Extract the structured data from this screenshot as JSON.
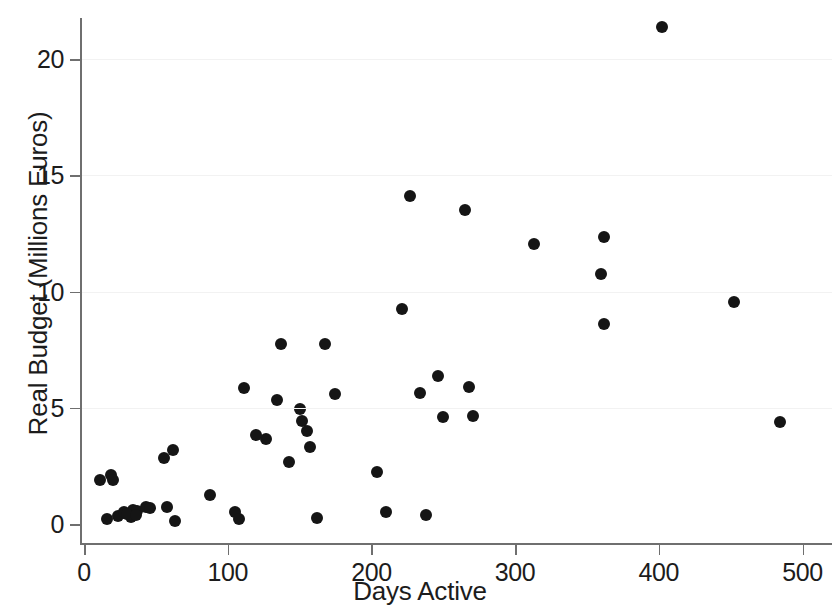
{
  "chart_data": {
    "type": "scatter",
    "title": "",
    "xlabel": "Days Active",
    "ylabel": "Real Budget (Millions Euros)",
    "xlim": [
      -8,
      520
    ],
    "ylim": [
      -0.7,
      22.6
    ],
    "xticks": [
      0,
      100,
      200,
      300,
      400,
      500
    ],
    "xtick_labels": [
      "0",
      "100",
      "200",
      "300",
      "400",
      "500"
    ],
    "yticks": [
      0,
      5,
      10,
      15,
      20
    ],
    "ytick_labels": [
      "0",
      "5",
      "10",
      "15",
      "20"
    ],
    "grid": false,
    "legend": "none",
    "marker": {
      "shape": "circle",
      "color": "#151515",
      "size": 12
    },
    "n_points": 52,
    "series": [
      {
        "name": "projects",
        "points": [
          [
            11,
            1.9
          ],
          [
            19,
            2.1
          ],
          [
            20,
            1.9
          ],
          [
            16,
            0.2
          ],
          [
            24,
            0.35
          ],
          [
            28,
            0.5
          ],
          [
            31,
            0.45
          ],
          [
            33,
            0.3
          ],
          [
            34,
            0.6
          ],
          [
            37,
            0.55
          ],
          [
            43,
            0.75
          ],
          [
            46,
            0.7
          ],
          [
            56,
            2.85
          ],
          [
            58,
            0.75
          ],
          [
            62,
            3.2
          ],
          [
            63,
            0.15
          ],
          [
            88,
            1.25
          ],
          [
            105,
            0.5
          ],
          [
            108,
            0.2
          ],
          [
            111,
            5.85
          ],
          [
            120,
            3.85
          ],
          [
            127,
            3.65
          ],
          [
            134,
            5.35
          ],
          [
            137,
            7.75
          ],
          [
            143,
            2.65
          ],
          [
            150,
            4.95
          ],
          [
            152,
            4.45
          ],
          [
            155,
            4.0
          ],
          [
            157,
            3.3
          ],
          [
            162,
            0.25
          ],
          [
            168,
            7.75
          ],
          [
            175,
            5.6
          ],
          [
            204,
            2.25
          ],
          [
            210,
            0.5
          ],
          [
            221,
            9.25
          ],
          [
            227,
            14.1
          ],
          [
            234,
            5.65
          ],
          [
            238,
            0.4
          ],
          [
            246,
            6.35
          ],
          [
            250,
            4.6
          ],
          [
            265,
            13.5
          ],
          [
            268,
            5.9
          ],
          [
            271,
            4.65
          ],
          [
            313,
            12.05
          ],
          [
            360,
            10.75
          ],
          [
            362,
            12.35
          ],
          [
            362,
            8.6
          ],
          [
            402,
            21.4
          ],
          [
            452,
            9.55
          ],
          [
            484,
            4.4
          ],
          [
            30,
            0.45
          ],
          [
            36,
            0.4
          ]
        ]
      }
    ]
  },
  "axes": {
    "y_title": "Real Budget (Millions Euros)",
    "x_title": "Days Active"
  }
}
